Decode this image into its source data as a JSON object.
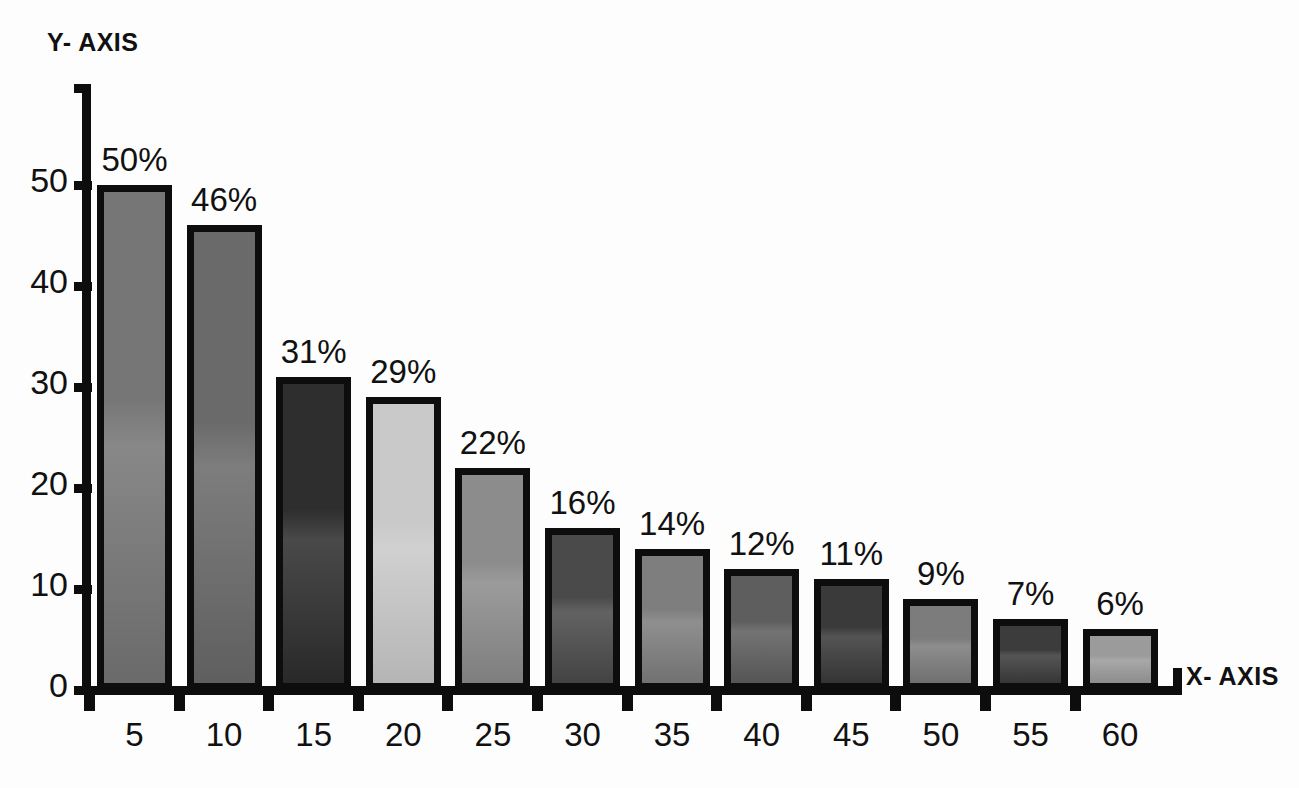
{
  "chart_data": {
    "type": "bar",
    "title": "",
    "xlabel": "X- AXIS",
    "ylabel": "Y- AXIS",
    "categories": [
      "5",
      "10",
      "15",
      "20",
      "25",
      "30",
      "35",
      "40",
      "45",
      "50",
      "55",
      "60"
    ],
    "values": [
      50,
      46,
      31,
      29,
      22,
      16,
      14,
      12,
      11,
      9,
      7,
      6
    ],
    "data_labels": [
      "50%",
      "46%",
      "31%",
      "29%",
      "22%",
      "16%",
      "14%",
      "12%",
      "11%",
      "9%",
      "7%",
      "6%"
    ],
    "y_ticks": [
      "0",
      "10",
      "20",
      "30",
      "40",
      "50"
    ],
    "y_tick_values": [
      0,
      10,
      20,
      30,
      40,
      50
    ],
    "ylim": [
      0,
      58
    ],
    "xlim_labels": [
      "5",
      "60"
    ],
    "grid": false,
    "legend": "none",
    "bar_colors": [
      "#767676",
      "#6a6a6a",
      "#2e2e2e",
      "#c9c9c9",
      "#8c8c8c",
      "#4a4a4a",
      "#7e7e7e",
      "#5e5e5e",
      "#3a3a3a",
      "#7c7c7c",
      "#3c3c3c",
      "#9b9b9b"
    ],
    "bar_border_color": "#0d0d0d",
    "axis_color": "#0d0d0d",
    "background_color": "#fdfdfd"
  }
}
